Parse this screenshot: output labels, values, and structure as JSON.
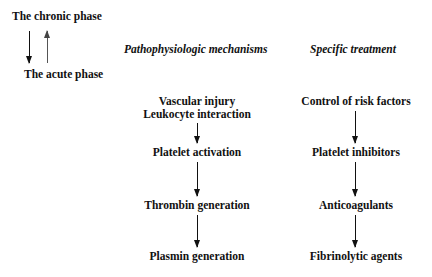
{
  "phases": {
    "chronic": "The chronic phase",
    "acute": "The acute phase",
    "arrows": [
      "chronic-to-acute (down)",
      "acute-to-chronic (up)"
    ]
  },
  "columns": {
    "mechanisms": {
      "header": "Pathophysiologic mechanisms",
      "steps": [
        "Vascular injury",
        "Leukocyte interaction",
        "Platelet activation",
        "Thrombin generation",
        "Plasmin generation"
      ]
    },
    "treatment": {
      "header": "Specific treatment",
      "steps": [
        "Control of risk factors",
        "Platelet inhibitors",
        "Anticoagulants",
        "Fibrinolytic agents"
      ]
    }
  }
}
